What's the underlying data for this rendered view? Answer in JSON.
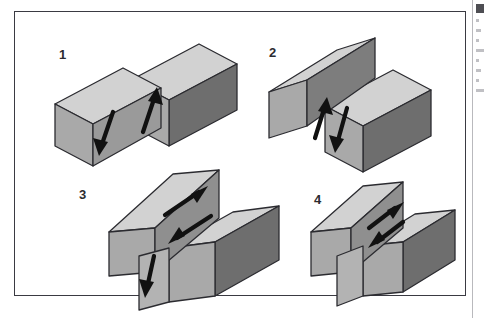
{
  "page": {
    "background_color": "#ffffff",
    "width": 489,
    "height": 318
  },
  "figure": {
    "frame_color": "#3a3a42",
    "caption": "",
    "panel_count": 4
  },
  "colors": {
    "top_face": "#d2d2d2",
    "front_face": "#a9a9a9",
    "side_face_dark": "#6e6e6e",
    "fault_plane": "#8f8f8f",
    "outline": "#2b2b30",
    "arrow": "#111111",
    "label_text": "#2b2b30",
    "column_rule": "#b9b9bd"
  },
  "panels": [
    {
      "label": "1",
      "fault_type": "normal fault",
      "description": "Block diagram of a normal fault: the left-hand (hanging wall) block has moved down and the right-hand block has moved up along an inclined fault plane.",
      "arrows": [
        {
          "name": "left-block-down-arrow",
          "direction": "down",
          "motion": "hanging wall down"
        },
        {
          "name": "right-block-up-arrow",
          "direction": "up",
          "motion": "footwall up"
        }
      ]
    },
    {
      "label": "2",
      "fault_type": "reverse fault",
      "description": "Block diagram of a reverse fault: the left-hand block has moved up and over the right-hand block which has moved down along an inclined fault plane.",
      "arrows": [
        {
          "name": "left-block-up-arrow",
          "direction": "up",
          "motion": "hanging wall up"
        },
        {
          "name": "right-block-down-arrow",
          "direction": "down",
          "motion": "footwall down"
        }
      ]
    },
    {
      "label": "3",
      "fault_type": "oblique-slip fault",
      "description": "Block diagram of an oblique-slip fault: blocks move both laterally past each other and vertically, combining strike-slip and dip-slip motion.",
      "arrows": [
        {
          "name": "strike-slip-up-right-arrow",
          "direction": "up-right",
          "motion": "lateral slip away"
        },
        {
          "name": "strike-slip-down-left-arrow",
          "direction": "down-left",
          "motion": "lateral slip toward"
        },
        {
          "name": "dip-slip-down-arrow",
          "direction": "down",
          "motion": "vertical drop of front block"
        }
      ]
    },
    {
      "label": "4",
      "fault_type": "strike-slip fault",
      "description": "Block diagram of a strike-slip fault: the two blocks slide horizontally past one another with no vertical offset.",
      "arrows": [
        {
          "name": "strike-slip-up-right-arrow",
          "direction": "up-right",
          "motion": "lateral slip away"
        },
        {
          "name": "strike-slip-down-left-arrow",
          "direction": "down-left",
          "motion": "lateral slip toward"
        }
      ]
    }
  ],
  "clipped_text_column": {
    "present": true,
    "legible": false,
    "note": "Body-text column cut off at the right page edge; glyphs are not legible."
  }
}
